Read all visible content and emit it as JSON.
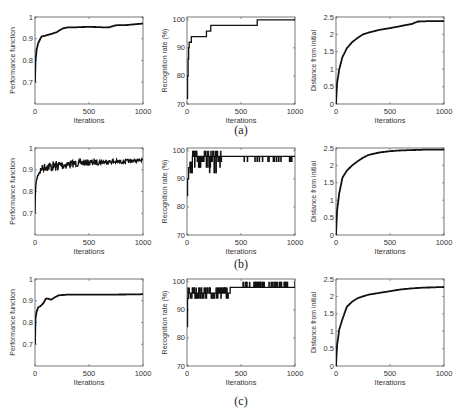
{
  "figure": {
    "captions": [
      "(a)",
      "(b)",
      "(c)"
    ]
  },
  "chart_data": [
    {
      "id": "a1",
      "row": 0,
      "col": 0,
      "type": "line",
      "title": "",
      "xlabel": "Iterations",
      "ylabel": "Performance function",
      "xlim": [
        0,
        1000
      ],
      "ylim": [
        0.6,
        1.0
      ],
      "xticks": [
        0,
        500,
        1000
      ],
      "yticks": [
        0.7,
        0.8,
        0.9,
        1
      ],
      "ytick_labels": [
        "0.7",
        "0.8",
        "0.9",
        "1"
      ],
      "grid": false,
      "legend": null,
      "x": [
        0,
        5,
        15,
        30,
        60,
        100,
        150,
        200,
        230,
        260,
        300,
        400,
        500,
        600,
        680,
        750,
        850,
        1000
      ],
      "values": [
        0.7,
        0.8,
        0.85,
        0.88,
        0.91,
        0.915,
        0.922,
        0.93,
        0.94,
        0.948,
        0.952,
        0.953,
        0.955,
        0.953,
        0.952,
        0.962,
        0.963,
        0.97
      ]
    },
    {
      "id": "a2",
      "row": 0,
      "col": 1,
      "type": "line",
      "step": true,
      "title": "",
      "xlabel": "Iterations",
      "ylabel": "Recognition rate (%)",
      "xlim": [
        0,
        1000
      ],
      "ylim": [
        70,
        101
      ],
      "xticks": [
        0,
        500,
        1000
      ],
      "yticks": [
        70,
        80,
        90,
        100
      ],
      "ytick_labels": [
        "70",
        "80",
        "90",
        "100"
      ],
      "grid": false,
      "legend": null,
      "x": [
        0,
        5,
        10,
        15,
        20,
        30,
        40,
        180,
        200,
        220,
        650,
        1000
      ],
      "values": [
        72,
        80,
        86,
        90,
        92,
        92,
        94,
        96,
        96,
        98,
        100,
        100
      ]
    },
    {
      "id": "a3",
      "row": 0,
      "col": 2,
      "type": "line",
      "title": "",
      "xlabel": "Iterations",
      "ylabel": "Distance from initial",
      "xlim": [
        0,
        1000
      ],
      "ylim": [
        0,
        2.5
      ],
      "xticks": [
        0,
        500,
        1000
      ],
      "yticks": [
        0,
        0.5,
        1,
        1.5,
        2,
        2.5
      ],
      "ytick_labels": [
        "0",
        "0.5",
        "1",
        "1.5",
        "2",
        "2.5"
      ],
      "grid": false,
      "legend": null,
      "x": [
        0,
        10,
        30,
        60,
        100,
        150,
        200,
        250,
        300,
        400,
        500,
        600,
        700,
        760,
        850,
        1000
      ],
      "values": [
        0,
        0.6,
        1.0,
        1.35,
        1.6,
        1.78,
        1.9,
        2.0,
        2.05,
        2.13,
        2.18,
        2.24,
        2.3,
        2.37,
        2.38,
        2.38
      ]
    },
    {
      "id": "b1",
      "row": 1,
      "col": 0,
      "type": "line",
      "noisy": true,
      "title": "",
      "xlabel": "Iterations",
      "ylabel": "Performance function",
      "xlim": [
        0,
        1000
      ],
      "ylim": [
        0.6,
        1.0
      ],
      "xticks": [
        0,
        500,
        1000
      ],
      "yticks": [
        0.7,
        0.8,
        0.9,
        1
      ],
      "ytick_labels": [
        "0.7",
        "0.8",
        "0.9",
        "1"
      ],
      "grid": false,
      "legend": null,
      "x": [
        0,
        5,
        15,
        30,
        60,
        100,
        150,
        200,
        300,
        400,
        500,
        600,
        700,
        800,
        900,
        1000
      ],
      "values": [
        0.7,
        0.82,
        0.86,
        0.89,
        0.92,
        0.935,
        0.94,
        0.942,
        0.945,
        0.945,
        0.948,
        0.948,
        0.947,
        0.947,
        0.948,
        0.95
      ],
      "noise_amplitude": [
        0,
        0,
        0.01,
        0.02,
        0.03,
        0.04,
        0.05,
        0.05,
        0.04,
        0.03,
        0.03,
        0.025,
        0.02,
        0.02,
        0.015,
        0.01
      ]
    },
    {
      "id": "b2",
      "row": 1,
      "col": 1,
      "type": "line",
      "step": true,
      "noisy": true,
      "title": "",
      "xlabel": "Iterations",
      "ylabel": "Recognition rate (%)",
      "xlim": [
        0,
        1000
      ],
      "ylim": [
        70,
        101
      ],
      "xticks": [
        0,
        500,
        1000
      ],
      "yticks": [
        70,
        80,
        90,
        100
      ],
      "ytick_labels": [
        "70",
        "80",
        "90",
        "100"
      ],
      "grid": false,
      "legend": null,
      "x": [
        0,
        5,
        15,
        30,
        50,
        100,
        200,
        300,
        320,
        500,
        1000
      ],
      "values": [
        84,
        90,
        94,
        96,
        98,
        98,
        98,
        98,
        98,
        98,
        98
      ],
      "spikes": {
        "dense_range": [
          30,
          320
        ],
        "dense_values": [
          92,
          94,
          96,
          100
        ],
        "sparse_x": [
          530,
          560,
          630,
          650,
          670,
          700,
          750,
          760,
          800,
          810,
          830,
          850,
          870,
          950,
          960,
          970
        ],
        "sparse_value": 96
      }
    },
    {
      "id": "b3",
      "row": 1,
      "col": 2,
      "type": "line",
      "title": "",
      "xlabel": "Iterations",
      "ylabel": "Distance from initial",
      "xlim": [
        0,
        1000
      ],
      "ylim": [
        0,
        2.5
      ],
      "xticks": [
        0,
        500,
        1000
      ],
      "yticks": [
        0,
        0.5,
        1,
        1.5,
        2,
        2.5
      ],
      "ytick_labels": [
        "0",
        "0.5",
        "1",
        "1.5",
        "2",
        "2.5"
      ],
      "grid": false,
      "legend": null,
      "x": [
        0,
        10,
        30,
        60,
        100,
        150,
        200,
        250,
        300,
        400,
        500,
        600,
        700,
        800,
        900,
        1000
      ],
      "values": [
        0,
        0.7,
        1.2,
        1.65,
        1.85,
        2.0,
        2.12,
        2.22,
        2.3,
        2.37,
        2.41,
        2.43,
        2.44,
        2.45,
        2.45,
        2.45
      ]
    },
    {
      "id": "c1",
      "row": 2,
      "col": 0,
      "type": "line",
      "title": "",
      "xlabel": "Iterations",
      "ylabel": "Performance function",
      "xlim": [
        0,
        1000
      ],
      "ylim": [
        0.6,
        1.0
      ],
      "xticks": [
        0,
        500,
        1000
      ],
      "yticks": [
        0.7,
        0.8,
        0.9,
        1
      ],
      "ytick_labels": [
        "0.7",
        "0.8",
        "0.9",
        "1"
      ],
      "grid": false,
      "legend": null,
      "x": [
        0,
        5,
        15,
        30,
        50,
        80,
        100,
        120,
        150,
        180,
        220,
        300,
        500,
        700,
        1000
      ],
      "values": [
        0.7,
        0.82,
        0.85,
        0.87,
        0.875,
        0.89,
        0.91,
        0.91,
        0.905,
        0.915,
        0.925,
        0.928,
        0.928,
        0.928,
        0.93
      ]
    },
    {
      "id": "c2",
      "row": 2,
      "col": 1,
      "type": "line",
      "step": true,
      "noisy": true,
      "title": "",
      "xlabel": "Iterations",
      "ylabel": "Recognition rate (%)",
      "xlim": [
        0,
        1000
      ],
      "ylim": [
        70,
        101
      ],
      "xticks": [
        0,
        500,
        1000
      ],
      "yticks": [
        70,
        80,
        90,
        100
      ],
      "ytick_labels": [
        "70",
        "80",
        "90",
        "100"
      ],
      "grid": false,
      "legend": null,
      "x": [
        0,
        5,
        10,
        80,
        400,
        1000
      ],
      "values": [
        84,
        94,
        96,
        96,
        98,
        100
      ],
      "spikes": {
        "band1_range": [
          10,
          380
        ],
        "band1_values": [
          94,
          96,
          98
        ],
        "band2_range": [
          520,
          930
        ],
        "band2_values": [
          98,
          100
        ]
      }
    },
    {
      "id": "c3",
      "row": 2,
      "col": 2,
      "type": "line",
      "title": "",
      "xlabel": "Iterations",
      "ylabel": "Distance from initial",
      "xlim": [
        0,
        1000
      ],
      "ylim": [
        0,
        2.5
      ],
      "xticks": [
        0,
        500,
        1000
      ],
      "yticks": [
        0,
        0.5,
        1,
        1.5,
        2,
        2.5
      ],
      "ytick_labels": [
        "0",
        "0.5",
        "1",
        "1.5",
        "2",
        "2.5"
      ],
      "grid": false,
      "legend": null,
      "x": [
        0,
        10,
        30,
        60,
        100,
        150,
        200,
        300,
        400,
        500,
        600,
        700,
        800,
        900,
        1000
      ],
      "values": [
        0,
        0.6,
        1.05,
        1.35,
        1.7,
        1.85,
        1.95,
        2.05,
        2.1,
        2.15,
        2.2,
        2.23,
        2.25,
        2.26,
        2.27
      ]
    }
  ]
}
